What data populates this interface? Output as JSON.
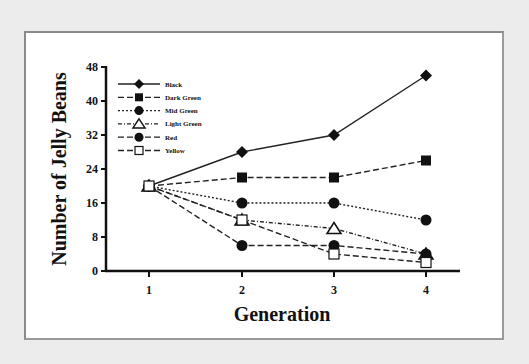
{
  "chart_data": {
    "type": "line",
    "title": "",
    "xlabel": "Generation",
    "ylabel": "Number of Jelly Beans",
    "x": [
      1,
      2,
      3,
      4
    ],
    "x_ticks": [
      "1",
      "2",
      "3",
      "4"
    ],
    "y_ticks": [
      "0",
      "8",
      "16",
      "24",
      "32",
      "40",
      "48"
    ],
    "ylim": [
      0,
      48
    ],
    "grid": false,
    "legend_position": "upper-left",
    "series": [
      {
        "name": "Black",
        "marker": "diamond-filled",
        "line": "solid",
        "values": [
          20,
          28,
          32,
          46
        ]
      },
      {
        "name": "Dark Green",
        "marker": "square-filled",
        "line": "dashed",
        "values": [
          20,
          22,
          22,
          26
        ]
      },
      {
        "name": "Mid Green",
        "marker": "circle-filled",
        "line": "dotted",
        "values": [
          20,
          16,
          16,
          12
        ]
      },
      {
        "name": "Light Green",
        "marker": "triangle-open",
        "line": "dash-dot",
        "values": [
          20,
          12,
          10,
          4
        ]
      },
      {
        "name": "Red",
        "marker": "circle-filled",
        "line": "dashed",
        "values": [
          20,
          6,
          6,
          4
        ]
      },
      {
        "name": "Yellow",
        "marker": "square-open",
        "line": "dashed",
        "values": [
          20,
          12,
          4,
          2
        ]
      }
    ]
  },
  "legend": {
    "items": [
      "Black",
      "Dark Green",
      "Mid Green",
      "Light Green",
      "Red",
      "Yellow"
    ]
  }
}
